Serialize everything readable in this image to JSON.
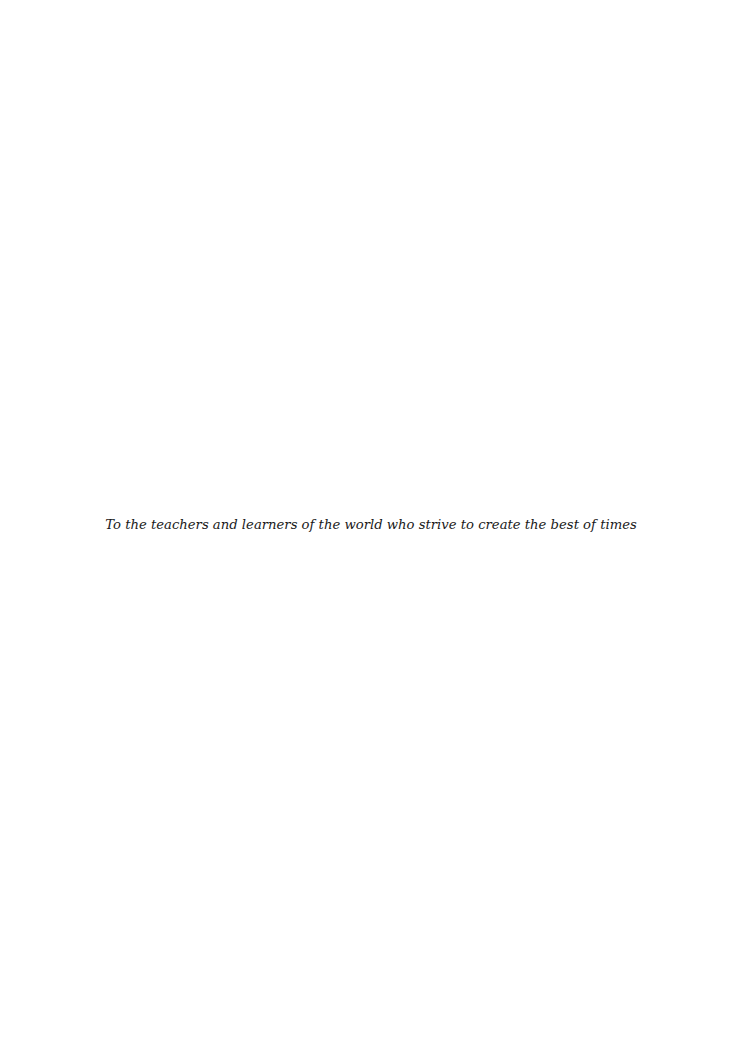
{
  "page": {
    "dedication": "To the teachers and learners of the world who strive to create the best of times"
  }
}
